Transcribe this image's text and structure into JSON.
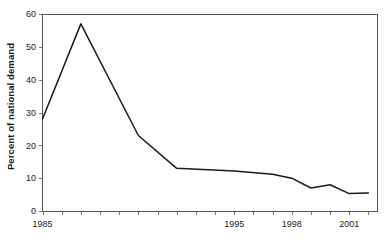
{
  "chart_data": {
    "type": "line",
    "title": "",
    "xlabel": "",
    "ylabel": "Percent of national demand",
    "xlim": [
      1985,
      2002.5
    ],
    "ylim": [
      0,
      60
    ],
    "grid": false,
    "legend": false,
    "x": [
      1985,
      1986,
      1987,
      1988,
      1989,
      1990,
      1991,
      1992,
      1993,
      1994,
      1995,
      1996,
      1997,
      1998,
      1999,
      2000,
      2001,
      2002
    ],
    "values": [
      28,
      42,
      57,
      45,
      34,
      23,
      19,
      16,
      14.5,
      13,
      12.8,
      12.2,
      11.6,
      11.2,
      10.4,
      9.8,
      8.2,
      7
    ],
    "series": [
      {
        "name": "Percent of national demand",
        "color": "#1a1a1a",
        "points": [
          {
            "x": 1985,
            "y": 28
          },
          {
            "x": 1987,
            "y": 57
          },
          {
            "x": 1990,
            "y": 23
          },
          {
            "x": 1992,
            "y": 13
          },
          {
            "x": 1995,
            "y": 12.2
          },
          {
            "x": 1997,
            "y": 11.2
          },
          {
            "x": 1998,
            "y": 10
          },
          {
            "x": 1999,
            "y": 7
          },
          {
            "x": 2000,
            "y": 8
          },
          {
            "x": 2001,
            "y": 5.3
          },
          {
            "x": 2002,
            "y": 5.5
          }
        ]
      }
    ],
    "y_ticks": [
      0,
      10,
      20,
      30,
      40,
      50,
      60
    ],
    "y_tick_labels": [
      "0",
      "10",
      "20",
      "30",
      "40",
      "50",
      "60"
    ],
    "x_ticks": [
      1985,
      1986,
      1987,
      1988,
      1989,
      1990,
      1991,
      1992,
      1993,
      1994,
      1995,
      1996,
      1997,
      1998,
      1999,
      2000,
      2001,
      2002
    ],
    "x_tick_labels": [
      {
        "value": 1985,
        "label": "1985"
      },
      {
        "value": 1995,
        "label": "1995"
      },
      {
        "value": 1998,
        "label": "1998"
      },
      {
        "value": 2001,
        "label": "2001"
      }
    ]
  }
}
